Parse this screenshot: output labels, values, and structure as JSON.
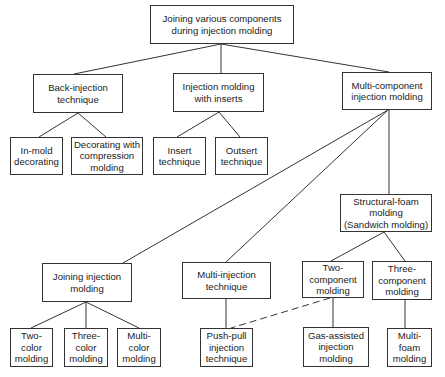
{
  "diagram": {
    "type": "hierarchy",
    "nodes": [
      {
        "id": "root",
        "label": "Joining various components\nduring injection molding",
        "x": 150,
        "y": 5,
        "w": 144,
        "h": 39
      },
      {
        "id": "back",
        "label": "Back-injection\ntechnique",
        "x": 33,
        "y": 74,
        "w": 90,
        "h": 39
      },
      {
        "id": "inserts",
        "label": "Injection molding\nwith inserts",
        "x": 173,
        "y": 73,
        "w": 91,
        "h": 39
      },
      {
        "id": "multicomp",
        "label": "Multi-component\ninjection molding",
        "x": 342,
        "y": 72,
        "w": 90,
        "h": 38
      },
      {
        "id": "inmold",
        "label": "In-mold\ndecorating",
        "x": 10,
        "y": 137,
        "w": 53,
        "h": 38
      },
      {
        "id": "decor",
        "label": "Decorating with\ncompression\nmolding",
        "x": 71,
        "y": 137,
        "w": 72,
        "h": 38
      },
      {
        "id": "insert",
        "label": "Insert\ntechnique",
        "x": 153,
        "y": 137,
        "w": 53,
        "h": 38
      },
      {
        "id": "outsert",
        "label": "Outsert\ntechnique",
        "x": 215,
        "y": 137,
        "w": 53,
        "h": 38
      },
      {
        "id": "structfoam",
        "label": "Structural-foam\nmolding\n(Sandwich molding)",
        "x": 340,
        "y": 194,
        "w": 92,
        "h": 38
      },
      {
        "id": "joininj",
        "label": "Joining injection\nmolding",
        "x": 42,
        "y": 263,
        "w": 90,
        "h": 39
      },
      {
        "id": "multiinj",
        "label": "Multi-injection\ntechnique",
        "x": 182,
        "y": 262,
        "w": 89,
        "h": 37
      },
      {
        "id": "twocomp",
        "label": "Two-\ncomponent\nmolding",
        "x": 302,
        "y": 261,
        "w": 62,
        "h": 37
      },
      {
        "id": "threecomp",
        "label": "Three-\ncomponent\nmolding",
        "x": 372,
        "y": 261,
        "w": 60,
        "h": 39
      },
      {
        "id": "twocolor",
        "label": "Two-\ncolor\nmolding",
        "x": 10,
        "y": 328,
        "w": 43,
        "h": 39
      },
      {
        "id": "threecolor",
        "label": "Three-\ncolor\nmolding",
        "x": 64,
        "y": 328,
        "w": 44,
        "h": 39
      },
      {
        "id": "multicolor",
        "label": "Multi-\ncolor\nmolding",
        "x": 117,
        "y": 328,
        "w": 44,
        "h": 39
      },
      {
        "id": "pushpull",
        "label": "Push-pull\ninjection\ntechnique",
        "x": 200,
        "y": 328,
        "w": 53,
        "h": 39
      },
      {
        "id": "gasassist",
        "label": "Gas-assisted\ninjection\nmolding",
        "x": 303,
        "y": 327,
        "w": 66,
        "h": 40
      },
      {
        "id": "multifoam",
        "label": "Multi-\nfoam\nmolding",
        "x": 387,
        "y": 328,
        "w": 45,
        "h": 39
      }
    ],
    "edges": [
      {
        "from": "root",
        "to": "back",
        "x1": 221,
        "y1": 44,
        "x2": 74,
        "y2": 74,
        "style": "solid"
      },
      {
        "from": "root",
        "to": "inserts",
        "x1": 221,
        "y1": 44,
        "x2": 221,
        "y2": 73,
        "style": "solid"
      },
      {
        "from": "root",
        "to": "multicomp",
        "x1": 221,
        "y1": 44,
        "x2": 389,
        "y2": 72,
        "style": "solid"
      },
      {
        "from": "back",
        "to": "inmold",
        "x1": 78,
        "y1": 113,
        "x2": 39,
        "y2": 137,
        "style": "solid"
      },
      {
        "from": "back",
        "to": "decor",
        "x1": 78,
        "y1": 113,
        "x2": 106,
        "y2": 137,
        "style": "solid"
      },
      {
        "from": "inserts",
        "to": "insert",
        "x1": 219,
        "y1": 112,
        "x2": 177,
        "y2": 137,
        "style": "solid"
      },
      {
        "from": "inserts",
        "to": "outsert",
        "x1": 219,
        "y1": 112,
        "x2": 240,
        "y2": 137,
        "style": "solid"
      },
      {
        "from": "multicomp",
        "to": "joininj",
        "x1": 388,
        "y1": 110,
        "x2": 123,
        "y2": 263,
        "style": "solid"
      },
      {
        "from": "multicomp",
        "to": "multiinj",
        "x1": 388,
        "y1": 110,
        "x2": 226,
        "y2": 262,
        "style": "solid"
      },
      {
        "from": "multicomp",
        "to": "structfoam",
        "x1": 389,
        "y1": 110,
        "x2": 389,
        "y2": 194,
        "style": "solid"
      },
      {
        "from": "structfoam",
        "to": "twocomp",
        "x1": 384,
        "y1": 232,
        "x2": 331,
        "y2": 261,
        "style": "solid"
      },
      {
        "from": "structfoam",
        "to": "threecomp",
        "x1": 384,
        "y1": 232,
        "x2": 405,
        "y2": 261,
        "style": "solid"
      },
      {
        "from": "joininj",
        "to": "twocolor",
        "x1": 86,
        "y1": 302,
        "x2": 31,
        "y2": 328,
        "style": "solid"
      },
      {
        "from": "joininj",
        "to": "threecolor",
        "x1": 86,
        "y1": 302,
        "x2": 86,
        "y2": 328,
        "style": "solid"
      },
      {
        "from": "joininj",
        "to": "multicolor",
        "x1": 86,
        "y1": 302,
        "x2": 139,
        "y2": 328,
        "style": "solid"
      },
      {
        "from": "multiinj",
        "to": "pushpull",
        "x1": 226,
        "y1": 299,
        "x2": 226,
        "y2": 328,
        "style": "solid"
      },
      {
        "from": "twocomp",
        "to": "pushpull",
        "x1": 330,
        "y1": 298,
        "x2": 231,
        "y2": 328,
        "style": "dashed"
      },
      {
        "from": "twocomp",
        "to": "gasassist",
        "x1": 333,
        "y1": 298,
        "x2": 333,
        "y2": 327,
        "style": "solid"
      },
      {
        "from": "threecomp",
        "to": "multifoam",
        "x1": 405,
        "y1": 300,
        "x2": 405,
        "y2": 328,
        "style": "solid"
      }
    ]
  },
  "colors": {
    "line": "#333333",
    "border": "#333333",
    "text": "#222222",
    "background": "#ffffff"
  }
}
